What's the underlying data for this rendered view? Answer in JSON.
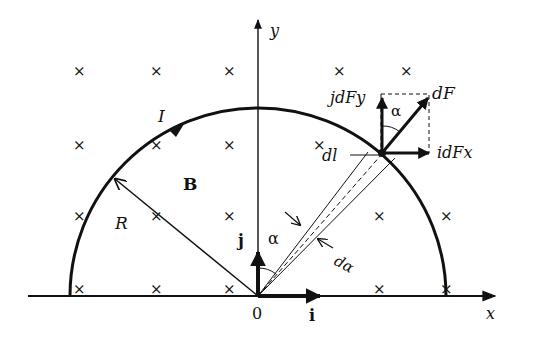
{
  "diagram": {
    "type": "physics-force-on-semicircular-current-loop",
    "axes": {
      "x_label": "x",
      "y_label": "y",
      "origin_label": "0"
    },
    "unit_vectors": {
      "i": "i",
      "j": "j"
    },
    "labels": {
      "current": "I",
      "field": "B",
      "radius": "R",
      "angle": "α",
      "angle_top": "α",
      "d_angle": "dα",
      "dl": "dl",
      "dF": "dF",
      "jdFy": "jdFy",
      "idFx": "idFx"
    },
    "field_markers": {
      "symbol": "×",
      "meaning": "B into page",
      "rows": [
        {
          "y": 71,
          "xs": [
            78,
            155,
            228,
            338,
            405
          ]
        },
        {
          "y": 145,
          "xs": [
            78,
            155,
            228,
            318
          ]
        },
        {
          "y": 216,
          "xs": [
            78,
            155,
            228,
            378,
            445
          ]
        },
        {
          "y": 289,
          "xs": [
            78,
            155,
            228,
            378,
            445
          ]
        }
      ]
    },
    "colors": {
      "ink": "#111111",
      "background": "#ffffff"
    }
  }
}
